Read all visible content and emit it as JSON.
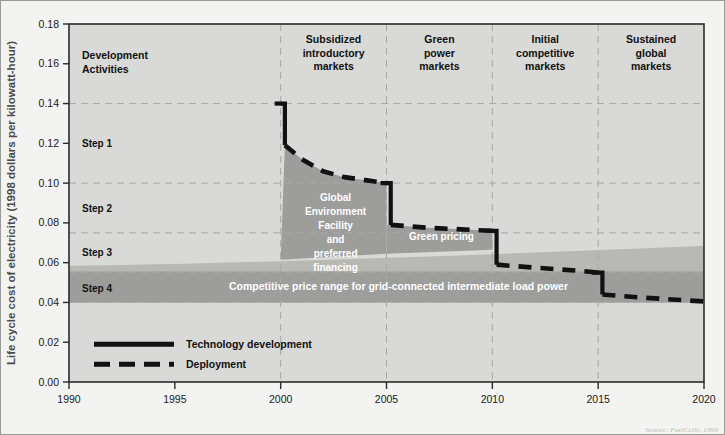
{
  "chart_data": {
    "type": "line",
    "title": "",
    "xlabel": "",
    "ylabel": "Life cycle cost of electricity (1998 dollars per kilowatt-hour)",
    "xlim": [
      1990,
      2020
    ],
    "ylim": [
      0.0,
      0.18
    ],
    "xticks": [
      "1990",
      "1995",
      "2000",
      "2005",
      "2010",
      "2015",
      "2020"
    ],
    "xtick_values": [
      1990,
      1995,
      2000,
      2005,
      2010,
      2015,
      2020
    ],
    "yticks": [
      "0.00",
      "0.02",
      "0.04",
      "0.06",
      "0.08",
      "0.10",
      "0.12",
      "0.14",
      "0.16",
      "0.18"
    ],
    "ytick_values": [
      0.0,
      0.02,
      0.04,
      0.06,
      0.08,
      0.1,
      0.12,
      0.14,
      0.16,
      0.18
    ],
    "grid": true,
    "gridlines_y": [
      0.04,
      0.055,
      0.075,
      0.1,
      0.14
    ],
    "legend_position": "inside-lower-left",
    "series": [
      {
        "name": "Technology development",
        "style": "solid",
        "color": "#111111",
        "points": [
          {
            "x": 2000.0,
            "y": 0.14
          },
          {
            "x": 2000.2,
            "y": 0.119
          },
          {
            "x": 2005.0,
            "y": 0.1
          },
          {
            "x": 2005.2,
            "y": 0.079
          },
          {
            "x": 2010.0,
            "y": 0.076
          },
          {
            "x": 2010.2,
            "y": 0.059
          },
          {
            "x": 2015.0,
            "y": 0.055
          },
          {
            "x": 2015.2,
            "y": 0.044
          }
        ]
      },
      {
        "name": "Deployment",
        "style": "dashed",
        "color": "#111111",
        "points": [
          {
            "x": 2000.2,
            "y": 0.119
          },
          {
            "x": 2001.0,
            "y": 0.112
          },
          {
            "x": 2002.0,
            "y": 0.106
          },
          {
            "x": 2003.0,
            "y": 0.103
          },
          {
            "x": 2004.0,
            "y": 0.1015
          },
          {
            "x": 2005.0,
            "y": 0.1
          },
          {
            "x": 2005.2,
            "y": 0.079
          },
          {
            "x": 2007.0,
            "y": 0.0775
          },
          {
            "x": 2009.0,
            "y": 0.0765
          },
          {
            "x": 2010.0,
            "y": 0.076
          },
          {
            "x": 2010.2,
            "y": 0.059
          },
          {
            "x": 2012.0,
            "y": 0.0575
          },
          {
            "x": 2014.0,
            "y": 0.056
          },
          {
            "x": 2015.0,
            "y": 0.055
          },
          {
            "x": 2015.2,
            "y": 0.044
          },
          {
            "x": 2017.0,
            "y": 0.0425
          },
          {
            "x": 2020.0,
            "y": 0.0405
          }
        ]
      }
    ],
    "bands": [
      {
        "name": "Competitive price range for grid-connected intermediate load power",
        "label": "Competitive price range for grid-connected intermediate load power",
        "color": "#9d9d9b",
        "y_lower": 0.04,
        "y_upper_start": 0.0555,
        "y_upper_end": 0.0555,
        "x_start": 1990,
        "x_end": 2020
      },
      {
        "name": "Technology cost envelope",
        "label": "",
        "color": "#b8b8b5",
        "y_lower": 0.04,
        "y_start": 0.0585,
        "y_end": 0.0685,
        "x_start": 1990,
        "x_end": 2020
      }
    ],
    "shaded_regions": [
      {
        "name": "Global Environment Facility and preferred financing",
        "label_lines": [
          "Global",
          "Environment",
          "Facility",
          "and",
          "preferred",
          "financing"
        ],
        "x_start": 2000,
        "x_end": 2005,
        "color": "#9d9d9b"
      },
      {
        "name": "Green pricing",
        "label_lines": [
          "Green pricing"
        ],
        "x_start": 2005,
        "x_end": 2010,
        "color": "#9d9d9b"
      }
    ],
    "phase_dividers": [
      2000,
      2005,
      2010,
      2015
    ],
    "phases": [
      {
        "name": "development-activities",
        "label_lines": [
          "Development",
          "Activities"
        ],
        "x_start": 1990,
        "x_end": 2000,
        "align": "left"
      },
      {
        "name": "subsidized-introductory-markets",
        "label_lines": [
          "Subsidized",
          "introductory",
          "markets"
        ],
        "x_start": 2000,
        "x_end": 2005,
        "align": "center"
      },
      {
        "name": "green-power-markets",
        "label_lines": [
          "Green",
          "power",
          "markets"
        ],
        "x_start": 2005,
        "x_end": 2010,
        "align": "center"
      },
      {
        "name": "initial-competitive-markets",
        "label_lines": [
          "Initial",
          "competitive",
          "markets"
        ],
        "x_start": 2010,
        "x_end": 2015,
        "align": "center"
      },
      {
        "name": "sustained-global-markets",
        "label_lines": [
          "Sustained",
          "global",
          "markets"
        ],
        "x_start": 2015,
        "x_end": 2020,
        "align": "center"
      }
    ],
    "step_labels": [
      {
        "name": "step-1",
        "label": "Step 1",
        "y": 0.12
      },
      {
        "name": "step-2",
        "label": "Step 2",
        "y": 0.0875
      },
      {
        "name": "step-3",
        "label": "Step 3",
        "y": 0.0655
      },
      {
        "name": "step-4",
        "label": "Step 4",
        "y": 0.0475
      }
    ],
    "legend": [
      {
        "name": "technology-development",
        "label": "Technology development",
        "style": "solid"
      },
      {
        "name": "deployment",
        "label": "Deployment",
        "style": "dashed"
      }
    ]
  },
  "source": {
    "text": "Source: FuelCells, 1999"
  },
  "colors": {
    "plot_background": "#d9d9d7",
    "page_background": "#f3f3f1",
    "band_dark": "#9d9d9b",
    "band_light": "#b8b8b5",
    "line": "#111111",
    "grid": "#a8a8a4",
    "axis": "#2a2a2a"
  }
}
